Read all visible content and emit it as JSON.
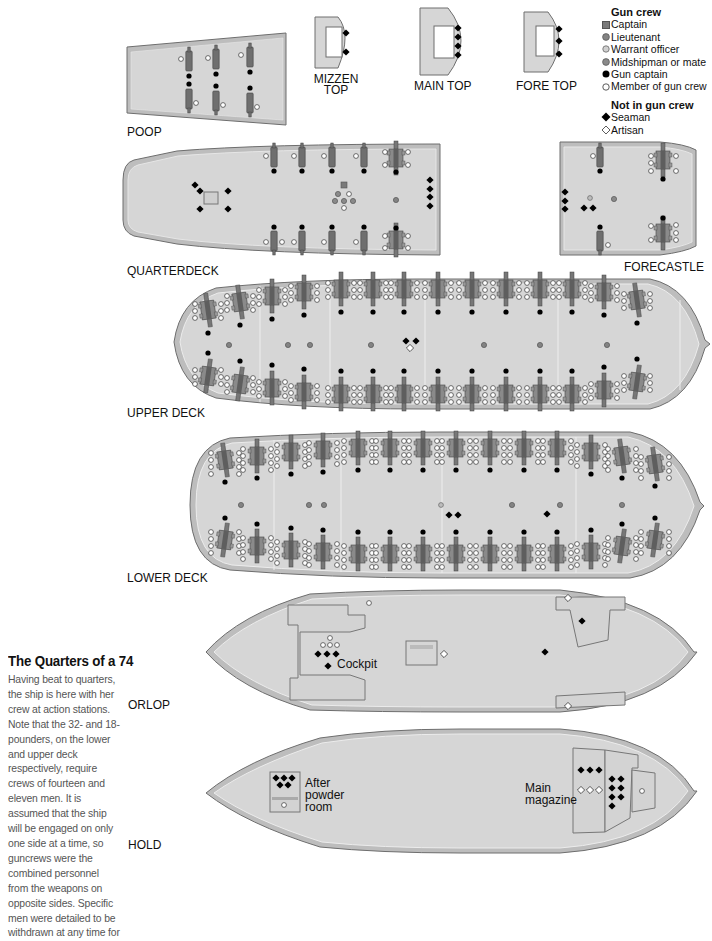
{
  "title": "The Quarters of a 74",
  "caption": "Having beat to quarters, the ship is here with her crew at action stations. Note that the 32- and 18- pounders, on the lower and upper deck respectively, require crews of fourteen and eleven men. It is assumed that the ship will be engaged on only one side at a time, so guncrews were the combined personnel from the weapons on opposite sides. Specific men were detailed to be withdrawn at any time for",
  "colors": {
    "deck_fill": "#d6d6d6",
    "deck_rim": "#bdbdbd",
    "deck_outline": "#6e6e6e",
    "gun": "#6f6f6f",
    "captain": "#7a7a7a",
    "lieutenant": "#838383",
    "warrant_officer": "#bdbdbd",
    "midshipman": "#8a8a8a",
    "gun_captain": "#000000",
    "member": "#ffffff",
    "seaman": "#000000",
    "artisan": "#ffffff"
  },
  "legend": {
    "gun_crew_heading": "Gun crew",
    "gun_crew": [
      {
        "symbol": "square-gray",
        "label": "Captain"
      },
      {
        "symbol": "circle-gray",
        "label": "Lieutenant"
      },
      {
        "symbol": "circle-light",
        "label": "Warrant officer"
      },
      {
        "symbol": "circle-midgray",
        "label": "Midshipman or mate"
      },
      {
        "symbol": "circle-black",
        "label": "Gun captain"
      },
      {
        "symbol": "circle-white",
        "label": "Member of gun crew"
      }
    ],
    "not_gun_crew_heading": "Not in gun crew",
    "not_gun_crew": [
      {
        "symbol": "diamond-black",
        "label": "Seaman"
      },
      {
        "symbol": "diamond-white",
        "label": "Artisan"
      }
    ]
  },
  "decks": {
    "poop": {
      "label": "POOP",
      "guns_per_side": 3
    },
    "mizzen_top": {
      "label": "MIZZEN TOP",
      "seamen": 2
    },
    "main_top": {
      "label": "MAIN TOP",
      "seamen": 4
    },
    "fore_top": {
      "label": "FORE TOP",
      "seamen": 3
    },
    "quarterdeck": {
      "label": "QUARTERDECK",
      "guns_per_side": 5,
      "seamen": 8
    },
    "forecastle": {
      "label": "FORECASTLE",
      "guns_per_side": 2,
      "seamen": 5
    },
    "upper_deck": {
      "label": "UPPER DECK",
      "guns_per_side": 14,
      "seamen": 2,
      "artisans": 1
    },
    "lower_deck": {
      "label": "LOWER DECK",
      "guns_per_side": 14,
      "seamen": 3
    },
    "orlop": {
      "label": "ORLOP",
      "cockpit_label": "Cockpit",
      "seamen": 6,
      "artisans": 3
    },
    "hold": {
      "label": "HOLD",
      "after_powder_room_label": "After powder room",
      "main_magazine_label": "Main magazine",
      "seamen": 15,
      "artisans": 3
    }
  },
  "text_labels": {
    "mizzen_line1": "MIZZEN",
    "mizzen_line2": "TOP",
    "after1": "After",
    "after2": "powder",
    "after3": "room",
    "main1": "Main",
    "main2": "magazine"
  }
}
